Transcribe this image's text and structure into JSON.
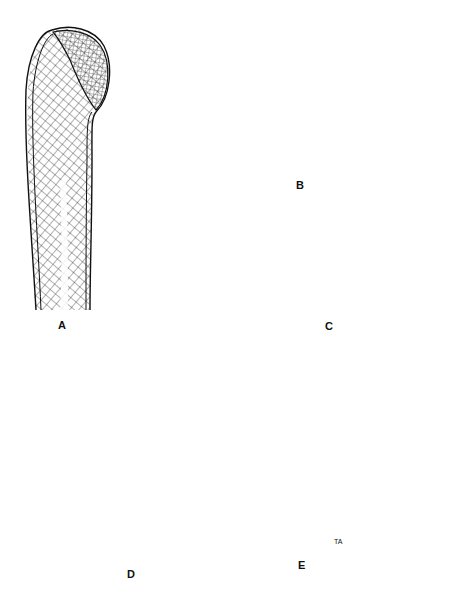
{
  "figure": {
    "type": "anatomical line illustration",
    "panels": [
      {
        "id": "A",
        "label": "A",
        "description": "Proximal humerus showing trabecular lines"
      },
      {
        "id": "B",
        "label": "B",
        "description": "Calcaneus-shaped bone with trabecular pattern"
      },
      {
        "id": "C",
        "label": "C",
        "description": "Curved bone section with cancellous interior and transverse line"
      },
      {
        "id": "D",
        "label": "D",
        "description": "Knee joint lateral view with arrow pointing to patella"
      },
      {
        "id": "E",
        "label": "E",
        "description": "Proximal femur showing trabecular lines",
        "signature": "TA"
      }
    ],
    "colors": {
      "ink": "#111111",
      "background": "#ffffff"
    }
  }
}
